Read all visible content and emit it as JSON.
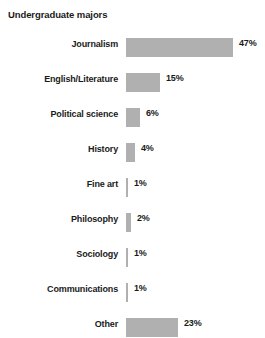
{
  "chart_data": {
    "type": "bar",
    "orientation": "horizontal",
    "title": "Undergraduate majors",
    "xlabel": "",
    "ylabel": "",
    "xlim": [
      0,
      50
    ],
    "grid": false,
    "legend": null,
    "value_suffix": "%",
    "bar_color": "#b0b0b0",
    "text_color": "#1a1a1a",
    "background_color": "#ffffff",
    "categories": [
      "Journalism",
      "English/Literature",
      "Political science",
      "History",
      "Fine art",
      "Philosophy",
      "Sociology",
      "Communications",
      "Other"
    ],
    "values": [
      47,
      15,
      6,
      4,
      1,
      2,
      1,
      1,
      23
    ],
    "value_labels": [
      "47%",
      "15%",
      "6%",
      "4%",
      "1%",
      "2%",
      "1%",
      "1%",
      "23%"
    ]
  }
}
